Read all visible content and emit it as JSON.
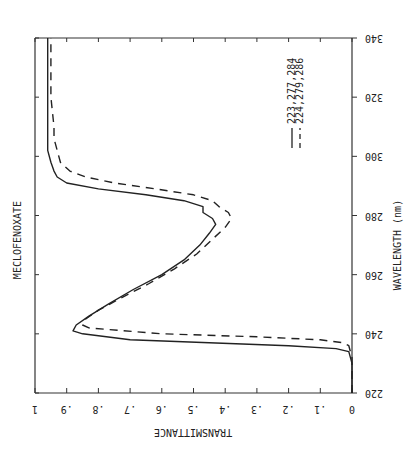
{
  "chart_data": {
    "type": "line",
    "orientation": "rotated 180deg: wavelength axis runs vertically (340 top, 220 bottom), transmittance horizontal (1 left, 0 right)",
    "title": "MECLOFENOXATE",
    "xlabel": "WAVELENGTH (nm)",
    "ylabel": "TRANSMITTANCE",
    "xlim": [
      220,
      340
    ],
    "ylim": [
      0,
      1
    ],
    "x_ticks": [
      220,
      240,
      260,
      280,
      300,
      320,
      340
    ],
    "y_ticks": [
      "0",
      ".1",
      ".2",
      ".3",
      ".4",
      ".5",
      ".6",
      ".7",
      ".8",
      ".9",
      "1"
    ],
    "grid": false,
    "legend_position": "upper right (rotated)",
    "series": [
      {
        "name": "223,277,284",
        "style": "solid",
        "x": [
          220,
          230,
          234,
          235,
          236,
          237,
          238,
          240,
          241,
          243,
          246,
          250,
          255,
          260,
          265,
          270,
          274,
          277,
          279,
          281,
          283,
          285,
          287,
          289,
          291,
          293,
          295,
          298,
          302,
          310,
          320,
          340
        ],
        "y": [
          0.0,
          0.0,
          0.01,
          0.05,
          0.2,
          0.45,
          0.7,
          0.85,
          0.88,
          0.87,
          0.83,
          0.77,
          0.69,
          0.6,
          0.53,
          0.48,
          0.45,
          0.43,
          0.44,
          0.47,
          0.47,
          0.53,
          0.65,
          0.8,
          0.9,
          0.93,
          0.94,
          0.95,
          0.96,
          0.96,
          0.96,
          0.96
        ]
      },
      {
        "name": "224,279,286",
        "style": "dashed",
        "x": [
          220,
          232,
          236,
          237,
          238,
          239,
          240,
          242,
          243,
          245,
          248,
          252,
          257,
          262,
          267,
          272,
          276,
          279,
          281,
          283,
          285,
          287,
          289,
          291,
          293,
          295,
          298,
          302,
          306,
          310,
          320,
          340
        ],
        "y": [
          0.0,
          0.0,
          0.01,
          0.03,
          0.1,
          0.3,
          0.6,
          0.83,
          0.85,
          0.84,
          0.8,
          0.73,
          0.64,
          0.56,
          0.49,
          0.44,
          0.4,
          0.38,
          0.39,
          0.42,
          0.44,
          0.5,
          0.62,
          0.75,
          0.84,
          0.89,
          0.92,
          0.93,
          0.94,
          0.94,
          0.95,
          0.95
        ]
      }
    ]
  }
}
